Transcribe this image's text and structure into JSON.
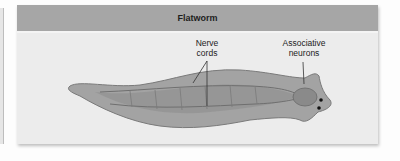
{
  "panel": {
    "title": "Flatworm"
  },
  "labels": {
    "nerve_cords": [
      "Nerve",
      "cords"
    ],
    "associative_neurons": [
      "Associative",
      "neurons"
    ]
  },
  "colors": {
    "header": "#a6a6a6",
    "panel_bg": "#ececec",
    "worm_body": "#9a9a9a",
    "worm_outline": "#777777"
  }
}
